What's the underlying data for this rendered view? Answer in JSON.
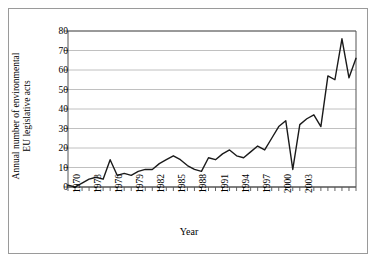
{
  "chart_data": {
    "type": "line",
    "title": "",
    "xlabel": "Year",
    "ylabel": "Annual number of environmental EU legislative acts",
    "ylabel_line1": "Annual number of environmental",
    "ylabel_line2": "EU legislative acts",
    "xlim": [
      1970,
      2003
    ],
    "ylim": [
      0,
      80
    ],
    "ytick_step": 10,
    "xtick_step": 1,
    "xtick_label_step": 3,
    "grid": "horizontal",
    "legend": "none",
    "line_color": "#1a1a1a",
    "grid_color": "#b0b0b0",
    "axis_color": "#555555",
    "yticks": [
      0,
      10,
      20,
      30,
      40,
      50,
      60,
      70,
      80
    ],
    "xticks": [
      1970,
      1971,
      1972,
      1973,
      1974,
      1975,
      1976,
      1977,
      1978,
      1979,
      1980,
      1981,
      1982,
      1983,
      1984,
      1985,
      1986,
      1987,
      1988,
      1989,
      1990,
      1991,
      1992,
      1993,
      1994,
      1995,
      1996,
      1997,
      1998,
      1999,
      2000,
      2001,
      2002,
      2003
    ],
    "xtick_labels": [
      "1970",
      "1973",
      "1976",
      "1979",
      "1982",
      "1985",
      "1988",
      "1991",
      "1994",
      "1997",
      "2000",
      "2003"
    ],
    "x": [
      1970,
      1971,
      1972,
      1973,
      1974,
      1975,
      1976,
      1977,
      1978,
      1979,
      1980,
      1981,
      1982,
      1983,
      1984,
      1985,
      1986,
      1987,
      1988,
      1989,
      1990,
      1991,
      1992,
      1993,
      1994,
      1995,
      1996,
      1997,
      1998,
      1999,
      2000,
      2001,
      2002,
      2003
    ],
    "values": [
      1,
      0,
      2,
      4,
      5,
      4,
      14,
      6,
      7,
      6,
      8,
      9,
      9,
      12,
      14,
      16,
      14,
      11,
      9,
      8,
      15,
      14,
      17,
      19,
      16,
      15,
      18,
      21,
      19,
      25,
      31,
      34,
      9,
      32
    ],
    "series": [
      {
        "name": "Annual number of environmental EU legislative acts",
        "points": [
          {
            "x": 1970,
            "y": 1
          },
          {
            "x": 1971,
            "y": 0
          },
          {
            "x": 1972,
            "y": 2
          },
          {
            "x": 1973,
            "y": 4
          },
          {
            "x": 1974,
            "y": 5
          },
          {
            "x": 1975,
            "y": 4
          },
          {
            "x": 1976,
            "y": 14
          },
          {
            "x": 1977,
            "y": 6
          },
          {
            "x": 1978,
            "y": 7
          },
          {
            "x": 1979,
            "y": 6
          },
          {
            "x": 1980,
            "y": 8
          },
          {
            "x": 1981,
            "y": 9
          },
          {
            "x": 1982,
            "y": 9
          },
          {
            "x": 1983,
            "y": 12
          },
          {
            "x": 1984,
            "y": 14
          },
          {
            "x": 1985,
            "y": 16
          },
          {
            "x": 1986,
            "y": 14
          },
          {
            "x": 1987,
            "y": 11
          },
          {
            "x": 1988,
            "y": 9
          },
          {
            "x": 1989,
            "y": 8
          },
          {
            "x": 1990,
            "y": 15
          },
          {
            "x": 1991,
            "y": 14
          },
          {
            "x": 1992,
            "y": 17
          },
          {
            "x": 1993,
            "y": 19
          },
          {
            "x": 1994,
            "y": 16
          },
          {
            "x": 1995,
            "y": 15
          },
          {
            "x": 1996,
            "y": 18
          },
          {
            "x": 1997,
            "y": 21
          },
          {
            "x": 1998,
            "y": 19
          },
          {
            "x": 1999,
            "y": 25
          },
          {
            "x": 2000,
            "y": 31
          },
          {
            "x": 2001,
            "y": 34
          },
          {
            "x": 2002,
            "y": 9
          },
          {
            "x": 2003,
            "y": 32
          }
        ]
      }
    ],
    "plot_points": [
      {
        "x": 1970,
        "y": 1
      },
      {
        "x": 1971,
        "y": 0
      },
      {
        "x": 1972,
        "y": 2
      },
      {
        "x": 1973,
        "y": 4
      },
      {
        "x": 1974,
        "y": 5
      },
      {
        "x": 1975,
        "y": 4
      },
      {
        "x": 1976,
        "y": 14
      },
      {
        "x": 1977,
        "y": 6
      },
      {
        "x": 1978,
        "y": 7
      },
      {
        "x": 1979,
        "y": 6
      },
      {
        "x": 1980,
        "y": 8
      },
      {
        "x": 1981,
        "y": 9
      },
      {
        "x": 1982,
        "y": 9
      },
      {
        "x": 1983,
        "y": 12
      },
      {
        "x": 1984,
        "y": 14
      },
      {
        "x": 1985,
        "y": 16
      },
      {
        "x": 1986,
        "y": 14
      },
      {
        "x": 1987,
        "y": 11
      },
      {
        "x": 1988,
        "y": 9
      },
      {
        "x": 1989,
        "y": 8
      },
      {
        "x": 1990,
        "y": 15
      },
      {
        "x": 1991,
        "y": 14
      },
      {
        "x": 1992,
        "y": 17
      },
      {
        "x": 1993,
        "y": 19
      },
      {
        "x": 1994,
        "y": 16
      },
      {
        "x": 1995,
        "y": 15
      },
      {
        "x": 1996,
        "y": 18
      },
      {
        "x": 1997,
        "y": 21
      },
      {
        "x": 1998,
        "y": 19
      },
      {
        "x": 1999,
        "y": 25
      },
      {
        "x": 2000,
        "y": 31
      },
      {
        "x": 2001,
        "y": 34
      },
      {
        "x": 2002,
        "y": 9
      },
      {
        "x": 2003,
        "y": 32
      },
      {
        "x": 2004,
        "y": 35
      },
      {
        "x": 2005,
        "y": 37
      },
      {
        "x": 2006,
        "y": 31
      },
      {
        "x": 2007,
        "y": 57
      },
      {
        "x": 2008,
        "y": 55
      },
      {
        "x": 2009,
        "y": 76
      },
      {
        "x": 2010,
        "y": 56
      },
      {
        "x": 2011,
        "y": 66
      }
    ]
  },
  "figure": {
    "xlabel": "Year",
    "ylabel_line1": "Annual number of environmental",
    "ylabel_line2": "EU legislative acts"
  }
}
